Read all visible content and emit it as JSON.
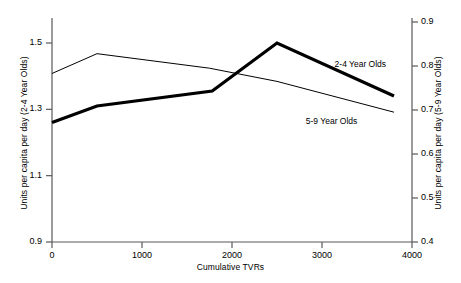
{
  "chart_data": {
    "type": "line",
    "title": "",
    "xlabel": "Cumulative TVRs",
    "xlim": [
      0,
      4000
    ],
    "xticks": [
      "0",
      "1000",
      "2000",
      "3000",
      "4000"
    ],
    "xtick_values": [
      0,
      1000,
      2000,
      3000,
      4000
    ],
    "grid": false,
    "legend_position": "inline-annotation",
    "axes": [
      {
        "id": "left",
        "label": "Units per capita per day (2-4 Year Olds)",
        "ylim": [
          0.9,
          1.5
        ],
        "yticks": [
          "0.9",
          "1.1",
          "1.3",
          "1.5"
        ],
        "ytick_values": [
          0.9,
          1.1,
          1.3,
          1.5
        ]
      },
      {
        "id": "right",
        "label": "Units per capita per day (5-9 Year Olds)",
        "ylim": [
          0.4,
          0.9
        ],
        "yticks": [
          "0.4",
          "0.5",
          "0.6",
          "0.7",
          "0.8",
          "0.9"
        ],
        "ytick_values": [
          0.4,
          0.5,
          0.6,
          0.7,
          0.8,
          0.9
        ]
      }
    ],
    "series": [
      {
        "name": "2-4 Year Olds",
        "axis": "left",
        "style": "thick",
        "line_width": 3.2,
        "color": "#000000",
        "x": [
          0,
          500,
          1780,
          2500,
          3800
        ],
        "values": [
          1.26,
          1.31,
          1.355,
          1.5,
          1.34
        ],
        "annotation": {
          "text": "2-4 Year Olds",
          "x": 3140,
          "y": 1.435
        }
      },
      {
        "name": "5-9 Year Olds",
        "axis": "right",
        "style": "thin",
        "line_width": 1.0,
        "color": "#000000",
        "x": [
          0,
          500,
          1750,
          2500,
          3800
        ],
        "values": [
          0.783,
          0.828,
          0.795,
          0.765,
          0.695
        ],
        "annotation": {
          "text": "5-9 Year Olds",
          "x": 2820,
          "y": 0.672
        }
      }
    ]
  },
  "annotations": {
    "series_2_4_label": "2-4 Year Olds",
    "series_5_9_label": "5-9 Year Olds"
  },
  "colors": {
    "axis": "#595959",
    "line": "#000000",
    "text": "#000000",
    "background": "#ffffff"
  }
}
